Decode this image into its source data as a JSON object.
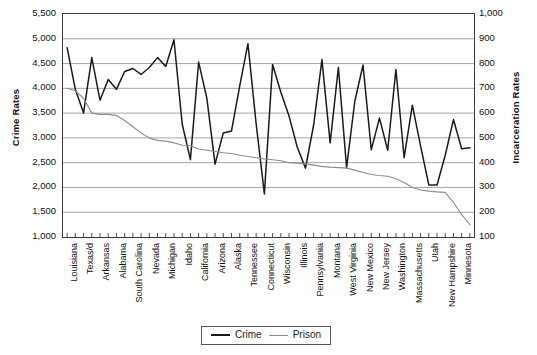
{
  "chart_data": {
    "type": "line",
    "title": "",
    "xlabel": "",
    "ylabel": "Crime Rates",
    "ylabel_right": "Incarceration Rates",
    "ylim": [
      1000,
      5500
    ],
    "ylim_right": [
      100,
      1000
    ],
    "yticks": [
      5500,
      5000,
      4500,
      4000,
      3500,
      3000,
      2500,
      2000,
      1500,
      1000
    ],
    "ytick_labels": [
      "5,500",
      "5,000",
      "4,500",
      "4,000",
      "3,500",
      "3,000",
      "2,500",
      "2,000",
      "1,500",
      "1,000"
    ],
    "yticks_right": [
      1000,
      900,
      800,
      700,
      600,
      500,
      400,
      300,
      200,
      100
    ],
    "ytick_labels_right": [
      "1,000",
      "900",
      "800",
      "700",
      "600",
      "500",
      "400",
      "300",
      "200",
      "100"
    ],
    "grid": true,
    "legend_position": "bottom-center",
    "categories": [
      "Louisiana",
      "Mississippi",
      "Texas/d",
      "Oklahoma",
      "Arkansas",
      "Georgia",
      "Alabama",
      "Florida",
      "South Carolina",
      "Arizona",
      "Nevada",
      "Missouri",
      "Michigan",
      "Ohio",
      "Idaho",
      "Indiana",
      "California",
      "Virginia",
      "Arizona",
      "Colorado",
      "Alaska",
      "Kentucky",
      "Tennessee",
      "Maryland",
      "Connecticut",
      "Delaware",
      "Wisconsin",
      "North Carolina",
      "Illinois",
      "Kansas",
      "Pennsylvania",
      "Oregon",
      "Montana",
      "Wyoming",
      "West Virginia",
      "South Dakota",
      "New Mexico",
      "Iowa",
      "New Jersey",
      "Nebraska",
      "Washington",
      "New York",
      "Massachusetts",
      "Hawaii",
      "Utah",
      "Rhode Island",
      "New Hampshire",
      "North Dakota",
      "Minnesota",
      "Vermont"
    ],
    "xtick_labels": [
      "Louisiana",
      "Texas/d",
      "Arkansas",
      "Alabama",
      "South Carolina",
      "Nevada",
      "Michigan",
      "Idaho",
      "California",
      "Arizona",
      "Alaska",
      "Tennessee",
      "Connecticut",
      "Wisconsin",
      "Illinois",
      "Pennsylvania",
      "Montana",
      "West Virginia",
      "New Mexico",
      "New Jersey",
      "Washington",
      "Massachusetts",
      "Utah",
      "New Hampshire",
      "Minnesota"
    ],
    "series": [
      {
        "name": "Crime",
        "axis": "left",
        "color": "#1a1a1a",
        "values": [
          4820,
          3980,
          3500,
          4620,
          3760,
          4180,
          3980,
          4340,
          4400,
          4280,
          4420,
          4620,
          4440,
          4980,
          3280,
          2560,
          4530,
          3800,
          2470,
          3100,
          3140,
          4050,
          4900,
          3280,
          1870,
          4480,
          3920,
          3440,
          2810,
          2390,
          3270,
          4580,
          2900,
          4420,
          2400,
          3740,
          4470,
          2760,
          3400,
          2750,
          4380,
          2600,
          3660,
          2840,
          2050,
          2050,
          2650,
          3370,
          2780,
          2800
        ]
      },
      {
        "name": "Prison",
        "axis": "right",
        "color": "#8c8c8c",
        "values": [
          700,
          690,
          660,
          600,
          595,
          595,
          590,
          570,
          545,
          520,
          500,
          490,
          487,
          480,
          470,
          468,
          455,
          450,
          445,
          440,
          437,
          430,
          425,
          420,
          415,
          412,
          408,
          400,
          398,
          395,
          390,
          385,
          382,
          380,
          378,
          370,
          360,
          352,
          348,
          345,
          335,
          320,
          300,
          290,
          285,
          282,
          280,
          240,
          190,
          150
        ]
      }
    ]
  },
  "legend": {
    "items": [
      {
        "label": "Crime",
        "color": "#1a1a1a",
        "width": "2.1px"
      },
      {
        "label": "Prison",
        "color": "#8c8c8c",
        "width": "1.5px"
      }
    ]
  }
}
